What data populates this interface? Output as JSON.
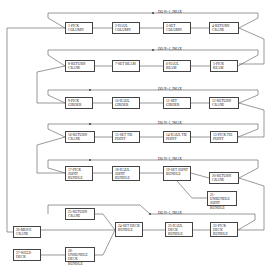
{
  "diagram": {
    "loops": [
      {
        "label": "DO N=1, IMAX",
        "y": 12
      },
      {
        "label": "DO N=1, IMAX",
        "y": 50
      },
      {
        "label": "DO N=1, IMAX",
        "y": 90
      },
      {
        "label": "DO N=1, IMAX",
        "y": 124
      },
      {
        "label": "DO N=1, IMAX",
        "y": 160
      },
      {
        "label": "DO N=1, IMAX",
        "y": 214
      }
    ],
    "boxes": [
      {
        "id": "b1",
        "text": "1-PICK COLUMN",
        "x": 65,
        "y": 22,
        "w": 28,
        "h": 12
      },
      {
        "id": "b2",
        "text": "2-HAUL COLUMN",
        "x": 112,
        "y": 22,
        "w": 28,
        "h": 12
      },
      {
        "id": "b3",
        "text": "3-SET COLUMN",
        "x": 163,
        "y": 22,
        "w": 28,
        "h": 12
      },
      {
        "id": "b4",
        "text": "4-RETURN CRANE",
        "x": 209,
        "y": 22,
        "w": 30,
        "h": 12
      },
      {
        "id": "b5",
        "text": "5-PICK BEAM",
        "x": 210,
        "y": 60,
        "w": 28,
        "h": 12
      },
      {
        "id": "b6",
        "text": "6-HAUL BEAM",
        "x": 163,
        "y": 60,
        "w": 28,
        "h": 12
      },
      {
        "id": "b7",
        "text": "7-SET BEAM",
        "x": 112,
        "y": 60,
        "w": 28,
        "h": 12
      },
      {
        "id": "b8",
        "text": "8-RETURN CRANE",
        "x": 65,
        "y": 60,
        "w": 30,
        "h": 12
      },
      {
        "id": "b9",
        "text": "9-PICK GIRDER",
        "x": 65,
        "y": 97,
        "w": 28,
        "h": 12
      },
      {
        "id": "b10",
        "text": "10-HAUL GIRDER",
        "x": 112,
        "y": 97,
        "w": 28,
        "h": 12
      },
      {
        "id": "b11",
        "text": "11-SET GIRDER",
        "x": 163,
        "y": 97,
        "w": 28,
        "h": 12
      },
      {
        "id": "b12",
        "text": "12-RETURN CRANE",
        "x": 209,
        "y": 97,
        "w": 30,
        "h": 12
      },
      {
        "id": "b13",
        "text": "13-PICK TIE POINT",
        "x": 210,
        "y": 131,
        "w": 28,
        "h": 12
      },
      {
        "id": "b14",
        "text": "14-HAUL TIE POINT",
        "x": 163,
        "y": 131,
        "w": 28,
        "h": 12
      },
      {
        "id": "b15",
        "text": "15-SET TIE POINT",
        "x": 112,
        "y": 131,
        "w": 28,
        "h": 12
      },
      {
        "id": "b16",
        "text": "16-RETURN CRANE",
        "x": 65,
        "y": 131,
        "w": 30,
        "h": 12
      },
      {
        "id": "b17",
        "text": "17-PICK JOINT BUNDLE",
        "x": 65,
        "y": 166,
        "w": 28,
        "h": 15
      },
      {
        "id": "b18",
        "text": "18-HAUL JOINT BUNDLE",
        "x": 112,
        "y": 166,
        "w": 28,
        "h": 15
      },
      {
        "id": "b19",
        "text": "19-SET JOINT BUNDLE",
        "x": 163,
        "y": 166,
        "w": 28,
        "h": 15
      },
      {
        "id": "b20",
        "text": "20-RETURN CRANE",
        "x": 209,
        "y": 172,
        "w": 30,
        "h": 12
      },
      {
        "id": "b21",
        "text": "21-UNBUNDLE JOINT BUNDLE",
        "x": 207,
        "y": 191,
        "w": 30,
        "h": 15
      },
      {
        "id": "b22",
        "text": "22-PICK DECK BUNDLE",
        "x": 210,
        "y": 222,
        "w": 28,
        "h": 15
      },
      {
        "id": "b23",
        "text": "23-HAUL DECK BUNDLE",
        "x": 165,
        "y": 222,
        "w": 28,
        "h": 15
      },
      {
        "id": "b24",
        "text": "24-SET DECK BUNDLE",
        "x": 115,
        "y": 222,
        "w": 28,
        "h": 15
      },
      {
        "id": "b25",
        "text": "25-RETURN CRANE",
        "x": 65,
        "y": 208,
        "w": 30,
        "h": 12
      },
      {
        "id": "b26",
        "text": "26-MOVE CRANE",
        "x": 13,
        "y": 226,
        "w": 28,
        "h": 12
      },
      {
        "id": "b27",
        "text": "27-WELD DECK",
        "x": 13,
        "y": 249,
        "w": 28,
        "h": 12
      },
      {
        "id": "b28",
        "text": "28-UNBUNDLE DECK BUNDLE",
        "x": 65,
        "y": 247,
        "w": 30,
        "h": 15
      }
    ]
  }
}
